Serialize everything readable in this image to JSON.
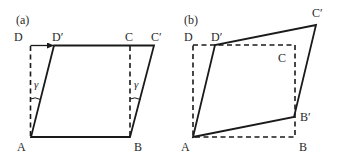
{
  "figure": {
    "panels": [
      {
        "id": "a",
        "tag": "(a)",
        "labels": {
          "D": "D",
          "D_prime": "D′",
          "C": "C",
          "C_prime": "C′",
          "A": "A",
          "B": "B"
        },
        "angle_symbol": "γ",
        "original_shape": "dashed square ABCD",
        "deformed_shape": "solid parallelogram ABC′D′",
        "arrow": "D → D′"
      },
      {
        "id": "b",
        "tag": "(b)",
        "labels": {
          "D": "D",
          "D_prime": "D′",
          "C": "C",
          "C_prime": "C′",
          "B_prime": "B′",
          "A": "A",
          "B": "B"
        },
        "original_shape": "dashed square ABCD",
        "deformed_shape": "solid rhombus AB′C′D′"
      }
    ]
  }
}
